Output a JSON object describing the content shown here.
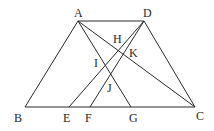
{
  "figure": {
    "type": "geometry",
    "points": {
      "A": {
        "label": "A",
        "x": 78,
        "y": 21,
        "lx": 74,
        "ly": 17
      },
      "D": {
        "label": "D",
        "x": 144,
        "y": 21,
        "lx": 143,
        "ly": 17
      },
      "B": {
        "label": "B",
        "x": 25,
        "y": 107,
        "lx": 14,
        "ly": 122
      },
      "E": {
        "label": "E",
        "x": 69,
        "y": 107,
        "lx": 63,
        "ly": 122
      },
      "F": {
        "label": "F",
        "x": 90,
        "y": 107,
        "lx": 85,
        "ly": 122
      },
      "G": {
        "label": "G",
        "x": 131,
        "y": 107,
        "lx": 129,
        "ly": 122
      },
      "C": {
        "label": "C",
        "x": 195,
        "y": 107,
        "lx": 196,
        "ly": 120
      },
      "H": {
        "label": "H",
        "x": 120,
        "y": 49,
        "lx": 113,
        "ly": 43
      },
      "K": {
        "label": "K",
        "x": 124,
        "y": 52,
        "lx": 129,
        "ly": 57
      },
      "I": {
        "label": "I",
        "x": 105,
        "y": 65,
        "lx": 93,
        "ly": 67
      },
      "J": {
        "label": "J",
        "x": 111,
        "y": 75,
        "lx": 107,
        "ly": 92
      }
    },
    "segments": [
      [
        "A",
        "D"
      ],
      [
        "B",
        "C"
      ],
      [
        "A",
        "B"
      ],
      [
        "D",
        "C"
      ],
      [
        "A",
        "C"
      ],
      [
        "A",
        "G"
      ],
      [
        "D",
        "E"
      ],
      [
        "D",
        "F"
      ]
    ]
  }
}
